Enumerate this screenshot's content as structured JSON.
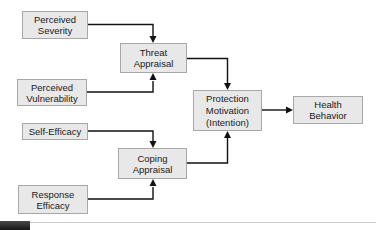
{
  "diagram": {
    "nodes": {
      "perceived_severity": {
        "label": "Perceived\nSeverity"
      },
      "perceived_vulnerability": {
        "label": "Perceived\nVulnerability"
      },
      "self_efficacy": {
        "label": "Self-Efficacy"
      },
      "response_efficacy": {
        "label": "Response\nEfficacy"
      },
      "threat_appraisal": {
        "label": "Threat\nAppraisal"
      },
      "coping_appraisal": {
        "label": "Coping\nAppraisal"
      },
      "protection_motivation": {
        "label": "Protection\nMotivation\n(Intention)"
      },
      "health_behavior": {
        "label": "Health\nBehavior"
      }
    },
    "edges": [
      {
        "from": "perceived_severity",
        "to": "threat_appraisal"
      },
      {
        "from": "perceived_vulnerability",
        "to": "threat_appraisal"
      },
      {
        "from": "self_efficacy",
        "to": "coping_appraisal"
      },
      {
        "from": "response_efficacy",
        "to": "coping_appraisal"
      },
      {
        "from": "threat_appraisal",
        "to": "protection_motivation"
      },
      {
        "from": "coping_appraisal",
        "to": "protection_motivation"
      },
      {
        "from": "protection_motivation",
        "to": "health_behavior"
      }
    ],
    "colors": {
      "node_fill": "#e8e8e8",
      "node_border": "#a8a8a8",
      "connector": "#111111",
      "footer_bar": "#2e2e2e",
      "footer_rule": "#cccccc"
    }
  }
}
